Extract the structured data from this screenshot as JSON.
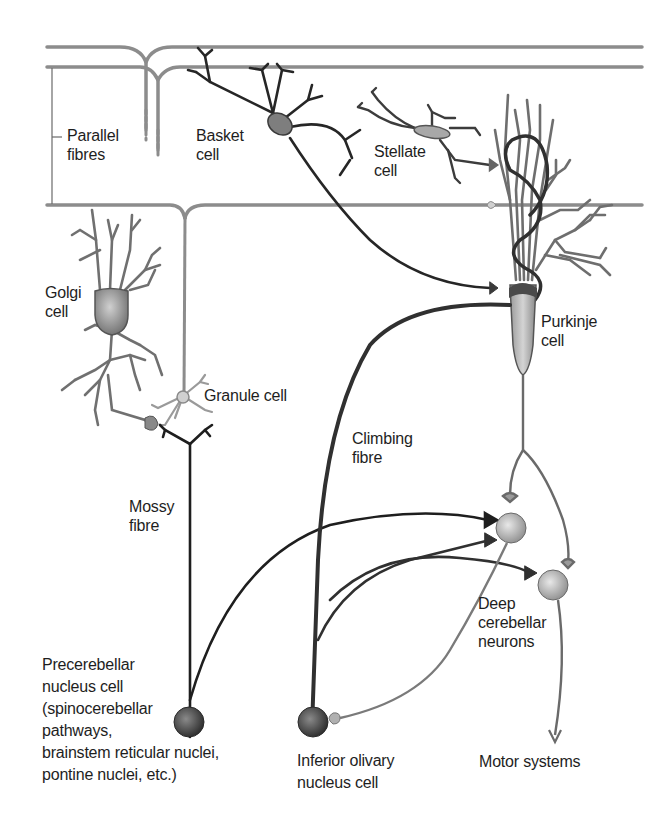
{
  "diagram": {
    "colors": {
      "background": "#ffffff",
      "parallel_fibre": "#8c8c8c",
      "dark_axon": "#1e1e1e",
      "climbing_fibre": "#3a3a3a",
      "purkinje": "#7a7a7a",
      "soma_light": "#c8c8c8",
      "soma_dark": "#3c3c3c",
      "text": "#1e1e1e"
    },
    "labels": {
      "parallel_fibres": "Parallel\nfibres",
      "basket_cell": "Basket\ncell",
      "stellate_cell": "Stellate\ncell",
      "golgi_cell": "Golgi\ncell",
      "purkinje_cell": "Purkinje\ncell",
      "granule_cell": "Granule cell",
      "climbing_fibre": "Climbing\nfibre",
      "mossy_fibre": "Mossy\nfibre",
      "deep_cerebellar_neurons": "Deep\ncerebellar\nneurons",
      "precerebellar_nucleus_cell": "Precerebellar\nnucleus cell\n(spinocerebellar\npathways,\nbrainstem reticular nuclei,\npontine nuclei, etc.)",
      "inferior_olivary_nucleus_cell": "Inferior olivary\nnucleus cell",
      "motor_systems": "Motor systems"
    }
  }
}
